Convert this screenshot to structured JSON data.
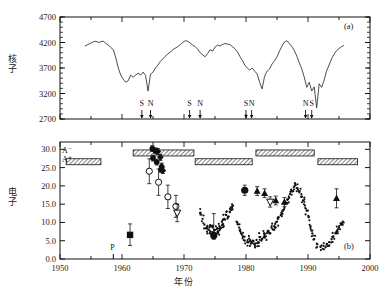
{
  "figure": {
    "panel_a_label": "(a)",
    "panel_b_label": "(b)",
    "xaxis_title": "年份",
    "panel_a_ylabel": "核子",
    "panel_b_ylabel": "电子",
    "xticklabels": [
      "1950",
      "1960",
      "1970",
      "1980",
      "1990",
      "2000"
    ],
    "panel_a_yticklabels": [
      "2700",
      "3200",
      "3700",
      "4200",
      "4700"
    ],
    "panel_b_yticklabels": [
      "0.0",
      "5.0",
      "10.0",
      "15.0",
      "20.0",
      "25.0",
      "30.0"
    ],
    "epoch_label_minus": "A⁻",
    "epoch_label_plus": "A⁺",
    "p_marker_label": "P",
    "reversal_markers": [
      {
        "label": "S",
        "year": 1963.2
      },
      {
        "label": "N",
        "year": 1964.6
      },
      {
        "label": "S",
        "year": 1970.9
      },
      {
        "label": "N",
        "year": 1972.6
      },
      {
        "label": "S",
        "year": 1980.0
      },
      {
        "label": "N",
        "year": 1980.9
      },
      {
        "label": "N",
        "year": 1989.6
      },
      {
        "label": "S",
        "year": 1990.6
      }
    ],
    "colors": {
      "axis": "#111111",
      "line": "#111111",
      "marker": "#111111",
      "hatch": "#555555"
    }
  },
  "chart_data": [
    {
      "type": "line",
      "title": "",
      "xlabel": "年份",
      "ylabel": "核子",
      "xlim": [
        1950,
        2000
      ],
      "ylim": [
        2700,
        4700
      ],
      "grid": false,
      "legend": null,
      "annotations": [
        "(a)"
      ],
      "series": [
        {
          "name": "Neutron monitor count rate",
          "x": [
            1954.0,
            1954.5,
            1955.0,
            1955.4,
            1955.8,
            1956.2,
            1956.6,
            1957.0,
            1957.4,
            1957.8,
            1958.2,
            1958.6,
            1959.0,
            1959.4,
            1959.8,
            1960.2,
            1960.6,
            1961.0,
            1961.4,
            1961.8,
            1962.2,
            1962.6,
            1963.0,
            1963.4,
            1963.8,
            1964.2,
            1964.6,
            1965.0,
            1965.4,
            1965.8,
            1966.2,
            1966.6,
            1967.0,
            1967.4,
            1967.8,
            1968.2,
            1968.6,
            1969.0,
            1969.4,
            1969.8,
            1970.2,
            1970.6,
            1971.0,
            1971.4,
            1971.8,
            1972.2,
            1972.6,
            1973.0,
            1973.4,
            1973.8,
            1974.2,
            1974.6,
            1975.0,
            1975.4,
            1975.8,
            1976.2,
            1976.6,
            1977.0,
            1977.4,
            1977.8,
            1978.2,
            1978.6,
            1979.0,
            1979.4,
            1979.8,
            1980.2,
            1980.6,
            1981.0,
            1981.4,
            1981.8,
            1982.2,
            1982.6,
            1983.0,
            1983.4,
            1983.8,
            1984.2,
            1984.6,
            1985.0,
            1985.4,
            1985.8,
            1986.2,
            1986.6,
            1987.0,
            1987.4,
            1987.8,
            1988.2,
            1988.6,
            1989.0,
            1989.4,
            1989.8,
            1990.2,
            1990.6,
            1991.0,
            1991.4,
            1991.8,
            1992.2,
            1992.6,
            1993.0,
            1993.4,
            1993.8,
            1994.2,
            1994.6,
            1995.0,
            1995.4,
            1995.8
          ],
          "y": [
            4130,
            4160,
            4190,
            4215,
            4225,
            4200,
            4215,
            4225,
            4180,
            4150,
            4100,
            4060,
            3900,
            3700,
            3560,
            3480,
            3420,
            3450,
            3560,
            3520,
            3560,
            3600,
            3560,
            3620,
            3550,
            3250,
            3580,
            3620,
            3700,
            3760,
            3830,
            3880,
            3930,
            3980,
            4010,
            4060,
            4090,
            4120,
            4160,
            4200,
            4235,
            4225,
            4190,
            4150,
            4120,
            4070,
            4000,
            3960,
            3920,
            3980,
            4060,
            4030,
            4110,
            4150,
            4130,
            4160,
            4180,
            4170,
            4160,
            4120,
            4080,
            4020,
            3930,
            3850,
            3760,
            3700,
            3660,
            3700,
            3640,
            3580,
            3420,
            3290,
            3540,
            3640,
            3680,
            3780,
            3840,
            3920,
            4030,
            4130,
            4210,
            4235,
            4180,
            4120,
            4040,
            3930,
            3800,
            3680,
            3520,
            3320,
            3420,
            3250,
            3330,
            2920,
            3390,
            3320,
            3460,
            3640,
            3760,
            3880,
            3970,
            4040,
            4080,
            4120,
            4140
          ]
        }
      ]
    },
    {
      "type": "scatter",
      "title": "",
      "xlabel": "年份",
      "ylabel": "电子",
      "xlim": [
        1950,
        2000
      ],
      "ylim": [
        0.0,
        32.0
      ],
      "grid": false,
      "legend": null,
      "annotations": [
        "(b)",
        "A⁻",
        "A⁺",
        "P"
      ],
      "epoch_bars": [
        {
          "epoch": "A-",
          "x0": 1961.8,
          "x1": 1971.6,
          "y": 29.0
        },
        {
          "epoch": "A-",
          "x0": 1981.6,
          "x1": 1991.0,
          "y": 29.0
        },
        {
          "epoch": "A+",
          "x0": 1951.0,
          "x1": 1956.6,
          "y": 26.6
        },
        {
          "epoch": "A+",
          "x0": 1971.8,
          "x1": 1981.0,
          "y": 26.6
        },
        {
          "epoch": "A+",
          "x0": 1991.6,
          "x1": 1998.0,
          "y": 26.6
        }
      ],
      "series": [
        {
          "name": "filled-square",
          "marker": "square-filled",
          "x": [
            1961.3
          ],
          "y": [
            6.6
          ],
          "yerr": [
            [
              2.9
            ],
            [
              3.0
            ]
          ]
        },
        {
          "name": "open-circle",
          "marker": "circle-open",
          "x": [
            1964.4,
            1965.9,
            1967.4,
            1968.7
          ],
          "y": [
            24.0,
            21.0,
            17.0,
            14.4
          ],
          "yerr": [
            [
              3.4,
              3.6,
              3.2,
              3.0
            ],
            [
              3.4,
              3.6,
              3.2,
              3.0
            ]
          ]
        },
        {
          "name": "filled-circle",
          "marker": "circle-filled",
          "x": [
            1964.9,
            1965.4,
            1965.0,
            1965.6,
            1966.3
          ],
          "y": [
            30.2,
            29.6,
            27.6,
            26.5,
            24.5
          ],
          "yerr": [
            [
              0.8,
              0.8,
              0.8,
              0.8,
              0.8
            ],
            [
              0.8,
              0.8,
              0.8,
              0.8,
              0.8
            ]
          ]
        },
        {
          "name": "filled-diamond",
          "marker": "diamond-filled",
          "x": [
            1965.8,
            1966.2,
            1966.4,
            1966.6
          ],
          "y": [
            29.4,
            27.8,
            25.4,
            24.2
          ],
          "yerr": [
            [
              0.8,
              0.8,
              0.8,
              0.8
            ],
            [
              0.8,
              0.8,
              0.8,
              0.8
            ]
          ]
        },
        {
          "name": "open-triangle-down",
          "marker": "triangle-down-open",
          "x": [
            1968.9,
            1983.9
          ],
          "y": [
            12.6,
            15.6
          ],
          "yerr": [
            [
              2.4,
              1.4
            ],
            [
              2.4,
              1.4
            ]
          ]
        },
        {
          "name": "filled-triangle-up",
          "marker": "triangle-up-filled",
          "x": [
            1981.8,
            1983.0,
            1984.8,
            1986.2,
            1994.6
          ],
          "y": [
            18.6,
            18.0,
            16.0,
            15.6,
            16.6
          ],
          "yerr": [
            [
              1.2,
              1.2,
              1.2,
              1.2,
              2.6
            ],
            [
              1.2,
              1.2,
              1.2,
              1.2,
              2.6
            ]
          ]
        },
        {
          "name": "filled-circle-large",
          "marker": "circle-filled-large",
          "x": [
            1974.8,
            1979.8
          ],
          "y": [
            6.4,
            18.8
          ],
          "yerr": [
            [
              1.0,
              1.4
            ],
            [
              6.0,
              1.4
            ]
          ]
        },
        {
          "name": "electron-flux-cluster",
          "marker": "dot-small",
          "x": [
            1972.6,
            1973.0,
            1973.3,
            1973.6,
            1973.9,
            1974.1,
            1974.3,
            1974.5,
            1974.7,
            1974.9,
            1975.1,
            1975.3,
            1975.5,
            1975.7,
            1975.9,
            1976.1,
            1976.3,
            1976.5,
            1976.8,
            1977.1,
            1977.4,
            1977.6,
            1977.9,
            1978.6,
            1978.9,
            1979.2,
            1979.5,
            1979.8,
            1980.2,
            1980.5,
            1980.8,
            1981.1,
            1981.4,
            1981.7,
            1982.0,
            1982.3,
            1982.6,
            1982.9,
            1983.2,
            1983.5,
            1983.8,
            1984.1,
            1984.4,
            1984.7,
            1985.0,
            1985.3,
            1985.6,
            1985.9,
            1986.2,
            1986.5,
            1986.8,
            1987.1,
            1987.4,
            1987.7,
            1988.0,
            1988.3,
            1988.6,
            1988.9,
            1989.2,
            1989.5,
            1989.8,
            1990.1,
            1990.4,
            1990.7,
            1991.0,
            1991.5,
            1992.0,
            1992.5,
            1993.0,
            1993.4,
            1993.8,
            1994.1,
            1994.4,
            1994.7,
            1995.0,
            1995.3,
            1995.6
          ],
          "y": [
            12.6,
            11.0,
            9.4,
            8.4,
            8.0,
            8.6,
            7.4,
            9.0,
            6.6,
            7.8,
            7.0,
            8.2,
            7.2,
            9.0,
            8.6,
            10.2,
            9.4,
            11.0,
            12.0,
            11.6,
            12.8,
            13.6,
            14.6,
            10.0,
            8.6,
            7.0,
            6.2,
            5.0,
            4.6,
            5.6,
            4.2,
            5.0,
            4.0,
            5.2,
            4.6,
            6.0,
            5.4,
            7.0,
            6.2,
            7.6,
            7.0,
            8.6,
            8.0,
            9.6,
            10.2,
            11.4,
            12.0,
            13.2,
            14.0,
            15.2,
            16.4,
            17.8,
            18.6,
            19.6,
            20.2,
            19.4,
            18.2,
            17.0,
            16.0,
            14.6,
            13.2,
            11.4,
            9.0,
            7.0,
            5.4,
            4.0,
            3.4,
            3.6,
            4.0,
            4.6,
            5.4,
            6.2,
            7.0,
            7.8,
            8.6,
            9.4,
            10.2
          ]
        }
      ]
    }
  ]
}
